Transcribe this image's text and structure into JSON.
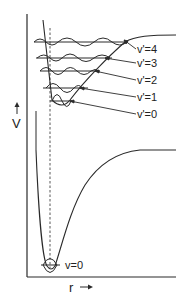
{
  "diagram": {
    "type": "potential-energy-curves",
    "y_axis_label": "V",
    "x_axis_label": "r",
    "ground_state": {
      "level_label": "v=0"
    },
    "excited_state": {
      "level_labels": [
        "v'=4",
        "v'=3",
        "v'=2",
        "v'=1",
        "v'=0"
      ]
    },
    "colors": {
      "line": "#2a2a2a",
      "background": "#ffffff"
    }
  }
}
